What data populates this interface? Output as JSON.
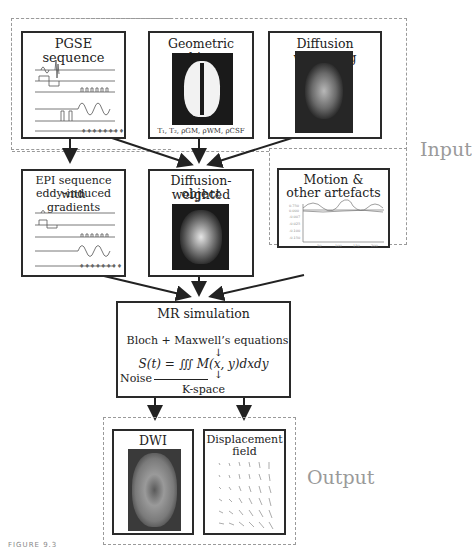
{
  "groups": {
    "input_label": "Input",
    "output_label": "Output"
  },
  "boxes": {
    "pgse": {
      "title": "PGSE sequence",
      "channel_labels": [
        "rf",
        "Gss",
        "Gro",
        "Gpe",
        "Gdiff",
        "signal"
      ]
    },
    "geometric": {
      "title": "Geometric object",
      "params": "T₁, T₂, ρGM, ρWM, ρCSF"
    },
    "diffusion_weighting": {
      "title": "Diffusion weighting"
    },
    "epi": {
      "title_line1": "EPI sequence with",
      "title_line2": "eddy-induced gradients"
    },
    "dw_object": {
      "title_line1": "Diffusion-weighted",
      "title_line2": "object"
    },
    "motion": {
      "title_line1": "Motion &",
      "title_line2": "other artefacts",
      "ytick_labels": [
        "0.750",
        "0.000",
        "-0.007",
        "-0.025",
        "-0.100",
        "-0.150"
      ],
      "xtick_labels": [
        "50",
        "100",
        "150",
        "200"
      ],
      "ylabel": "Magnitude"
    },
    "mr_sim": {
      "title": "MR simulation",
      "line1": "Bloch + Maxwell’s equations",
      "equation": "S(t) = ∭ M(x, y)dxdy",
      "noise": "Noise",
      "kspace": "K-space"
    },
    "dwi": {
      "title": "DWI"
    },
    "displacement": {
      "title_line1": "Displacement",
      "title_line2": "field"
    }
  },
  "caption": "FIGURE 9.3"
}
